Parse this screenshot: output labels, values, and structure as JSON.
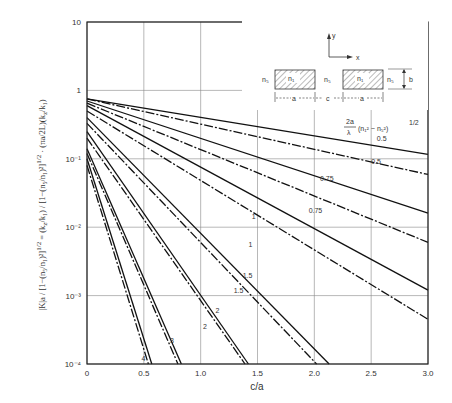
{
  "chart_data": {
    "type": "line",
    "title": "",
    "xlabel": "c/a",
    "ylabel": "|K|a / [1-(n5/n1)^2]^1/2 = (kz/k1) / [1-(n5/n1)^2]^1/2 · (πa/2L)(kz/k1)",
    "xscale": "linear",
    "yscale": "log",
    "xlim": [
      0,
      3.0
    ],
    "ylim": [
      0.0001,
      10
    ],
    "grid": true,
    "x_ticks": [
      "0",
      "0.5",
      "1.0",
      "1.5",
      "2.0",
      "2.5",
      "3.0"
    ],
    "y_ticks": [
      "10",
      "1",
      "10⁻¹",
      "10⁻²",
      "10⁻³",
      "10⁻⁴"
    ],
    "legend_title": "(2a/λ)(n1² − n5²)^1/2",
    "legend_note": "solid and dash-dot curves pair per parameter value",
    "series": [
      {
        "name": "0.5",
        "style": "solid",
        "x": [
          0,
          3.0
        ],
        "y": [
          0.75,
          0.116
        ]
      },
      {
        "name": "0.5",
        "style": "dashdot",
        "x": [
          0,
          3.0
        ],
        "y": [
          0.75,
          0.059
        ]
      },
      {
        "name": "0.75",
        "style": "solid",
        "x": [
          0,
          3.0
        ],
        "y": [
          0.7,
          0.016
        ]
      },
      {
        "name": "0.75",
        "style": "dashdot",
        "x": [
          0,
          3.0
        ],
        "y": [
          0.65,
          0.006
        ]
      },
      {
        "name": "1",
        "style": "solid",
        "x": [
          0,
          3.0
        ],
        "y": [
          0.6,
          0.0012
        ]
      },
      {
        "name": "1",
        "style": "dashdot",
        "x": [
          0,
          3.0
        ],
        "y": [
          0.5,
          0.00045
        ]
      },
      {
        "name": "1.5",
        "style": "solid",
        "x": [
          0,
          2.13
        ],
        "y": [
          0.4,
          0.0001
        ]
      },
      {
        "name": "1.5",
        "style": "dashdot",
        "x": [
          0,
          2.02
        ],
        "y": [
          0.33,
          0.0001
        ]
      },
      {
        "name": "2",
        "style": "solid",
        "x": [
          0,
          1.42
        ],
        "y": [
          0.25,
          0.0001
        ]
      },
      {
        "name": "2",
        "style": "dashdot",
        "x": [
          0,
          1.39
        ],
        "y": [
          0.2,
          0.0001
        ]
      },
      {
        "name": "3",
        "style": "solid",
        "x": [
          0,
          0.83
        ],
        "y": [
          0.14,
          0.0001
        ]
      },
      {
        "name": "3",
        "style": "dashdot",
        "x": [
          0,
          0.8
        ],
        "y": [
          0.12,
          0.0001
        ]
      },
      {
        "name": "4",
        "style": "solid",
        "x": [
          0,
          0.57
        ],
        "y": [
          0.1,
          0.0001
        ]
      },
      {
        "name": "4",
        "style": "dashdot",
        "x": [
          0,
          0.54
        ],
        "y": [
          0.08,
          0.0001
        ]
      }
    ],
    "curve_labels": [
      {
        "text": "0.5",
        "x": 2.55,
        "y": 0.18
      },
      {
        "text": "0.5",
        "x": 2.5,
        "y": 0.085
      },
      {
        "text": "0.75",
        "x": 2.05,
        "y": 0.048
      },
      {
        "text": "0.75",
        "x": 1.95,
        "y": 0.016
      },
      {
        "text": "1",
        "x": 1.45,
        "y": 0.013
      },
      {
        "text": "1",
        "x": 1.42,
        "y": 0.0052
      },
      {
        "text": "1.5",
        "x": 1.37,
        "y": 0.0018
      },
      {
        "text": "1.5",
        "x": 1.29,
        "y": 0.0011
      },
      {
        "text": "2",
        "x": 1.13,
        "y": 0.00055
      },
      {
        "text": "2",
        "x": 1.02,
        "y": 0.00032
      },
      {
        "text": "3",
        "x": 0.73,
        "y": 0.0002
      },
      {
        "text": "4",
        "x": 0.48,
        "y": 0.00011
      }
    ],
    "inset": {
      "axis_y": "y",
      "axis_x": "x",
      "core_label": "n₁",
      "cladding_label": "n₅",
      "width_label": "a",
      "gap_label": "c",
      "height_label": "b"
    }
  }
}
